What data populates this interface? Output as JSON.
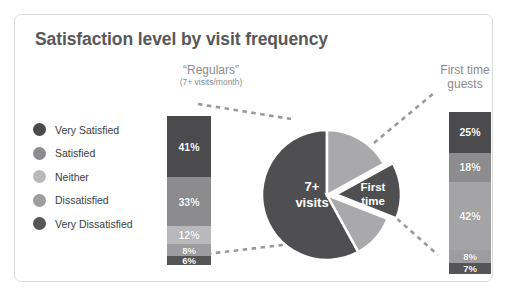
{
  "chart_data": {
    "type": "bar",
    "title": "Satisfaction level by visit frequency",
    "xlabel": "",
    "ylabel": "",
    "legend_position": "left",
    "categories": [
      "Very Satisfied",
      "Satisfied",
      "Neither",
      "Dissatisfied",
      "Very Dissatisfied"
    ],
    "series": [
      {
        "name": "“Regulars” (7+ visits/month)",
        "values": [
          41,
          33,
          12,
          8,
          6
        ],
        "labels": [
          "41%",
          "33%",
          "12%",
          "8%",
          "6%"
        ]
      },
      {
        "name": "First time guests",
        "values": [
          25,
          18,
          42,
          8,
          7
        ],
        "labels": [
          "25%",
          "18%",
          "42%",
          "8%",
          "7%"
        ]
      }
    ],
    "pie": {
      "type": "pie",
      "slices": [
        {
          "label": "7+ visits",
          "value": 58,
          "color": "#4f4f51",
          "exploded": false
        },
        {
          "label": "",
          "value": 17,
          "color": "#a9a9ab",
          "exploded": false
        },
        {
          "label": "First time",
          "value": 14,
          "color": "#4f4f51",
          "exploded": true
        },
        {
          "label": "",
          "value": 11,
          "color": "#a9a9ab",
          "exploded": false
        }
      ]
    },
    "ylim": [
      0,
      100
    ]
  },
  "card": {
    "title": "Satisfaction level by visit frequency"
  },
  "headers": {
    "left_title": "“Regulars”",
    "left_subtitle": "(7+ visits/month)",
    "right_line1": "First time",
    "right_line2": "guests"
  },
  "legend": {
    "items": [
      {
        "label": "Very Satisfied",
        "color": "#4b4b4d"
      },
      {
        "label": "Satisfied",
        "color": "#8c8c8e"
      },
      {
        "label": "Neither",
        "color": "#b9b9bb"
      },
      {
        "label": "Dissatisfied",
        "color": "#9d9d9f"
      },
      {
        "label": "Very Dissatisfied",
        "color": "#555557"
      }
    ]
  },
  "bars": {
    "left": {
      "name": "“Regulars”",
      "segments": [
        {
          "label": "41%",
          "value": 41,
          "color": "#4b4b4d"
        },
        {
          "label": "33%",
          "value": 33,
          "color": "#8c8c8e"
        },
        {
          "label": "12%",
          "value": 12,
          "color": "#b9b9bb"
        },
        {
          "label": "8%",
          "value": 8,
          "color": "#9d9d9f"
        },
        {
          "label": "6%",
          "value": 6,
          "color": "#555557"
        }
      ]
    },
    "right": {
      "name": "First time guests",
      "segments": [
        {
          "label": "25%",
          "value": 25,
          "color": "#4b4b4d"
        },
        {
          "label": "18%",
          "value": 18,
          "color": "#8c8c8e"
        },
        {
          "label": "42%",
          "value": 42,
          "color": "#a4a4a6"
        },
        {
          "label": "8%",
          "value": 8,
          "color": "#9d9d9f"
        },
        {
          "label": "7%",
          "value": 7,
          "color": "#555557"
        }
      ]
    }
  },
  "pie": {
    "center_label_line1": "7+",
    "center_label_line2": "visits",
    "slice_label_line1": "First",
    "slice_label_line2": "time"
  }
}
